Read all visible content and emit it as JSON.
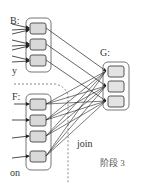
{
  "diagram": {
    "groups": [
      {
        "id": "B",
        "label": "B:",
        "partitions": 3
      },
      {
        "id": "F",
        "label": "F:",
        "partitions": 4
      },
      {
        "id": "G",
        "label": "G:",
        "partitions": 3
      }
    ],
    "edge_label": "join",
    "stage_label": "阶段 3",
    "left_labels": {
      "top": "y",
      "bottom": "on"
    },
    "colors": {
      "partition_fill": "#d9d9d9",
      "border": "#666666",
      "line": "#222222"
    }
  }
}
